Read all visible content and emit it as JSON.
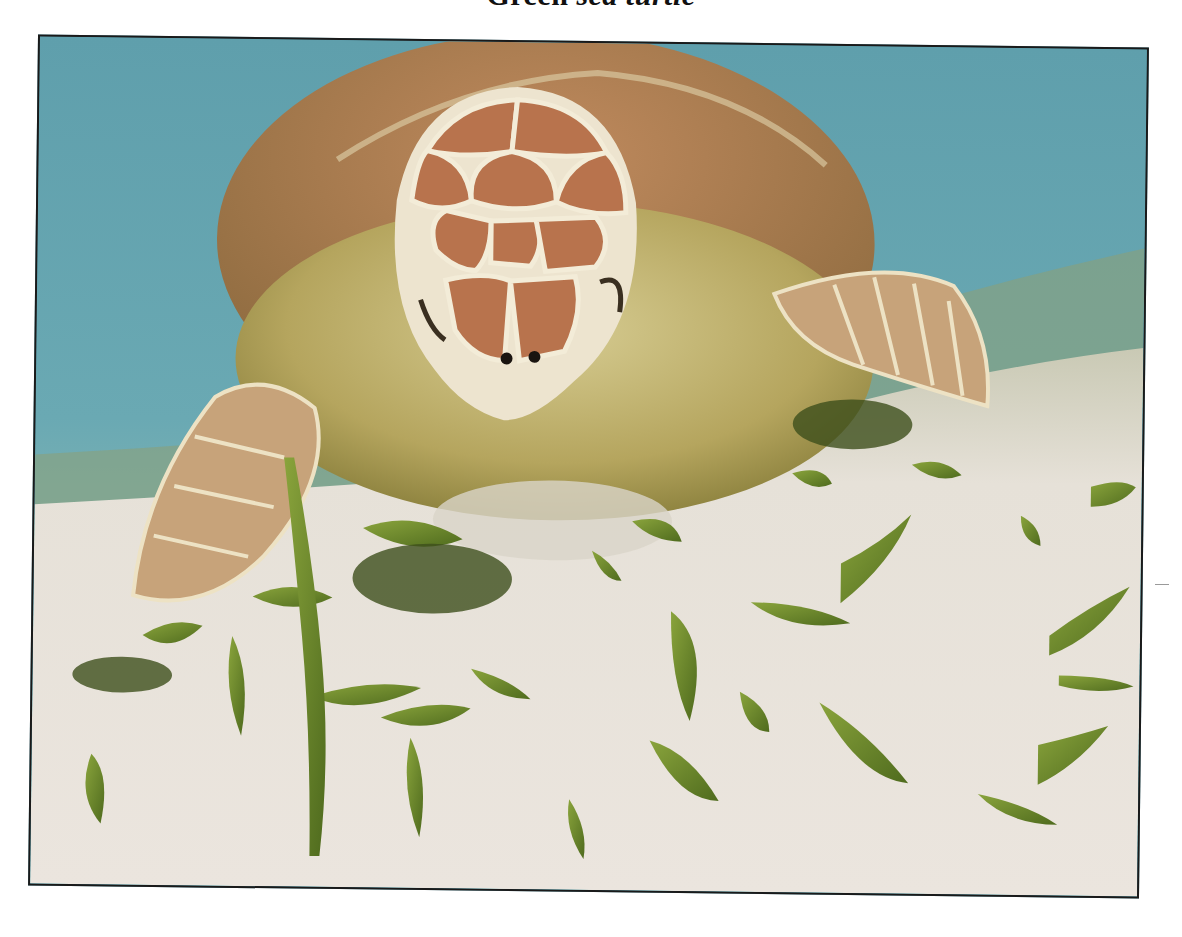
{
  "caption": {
    "prefix": "Green ",
    "italic": "sea turtle"
  },
  "photo": {
    "subject": "green sea turtle feeding on seagrass",
    "colors": {
      "water": "#5c9eab",
      "water_light": "#7bb5bb",
      "sand": "#e8e2da",
      "seagrass": "#6b8a2c",
      "shell_scute": "#b8744e",
      "scute_border": "#f1e9d6",
      "skin": "#b9ad6c",
      "frame_border": "#1a1a1a"
    }
  }
}
